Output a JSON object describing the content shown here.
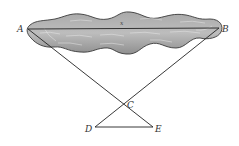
{
  "diagram": {
    "title": "",
    "colors": {
      "background": "#ffffff",
      "lake_fill": "#9a9a9a",
      "lake_fill_light": "#c4c4c4",
      "lake_stroke": "#3a3a3a",
      "line": "#222222",
      "label": "#333333",
      "ripple": "#e6e6e6"
    },
    "points": {
      "A": {
        "label": "A",
        "x": 28,
        "y": 29
      },
      "B": {
        "label": "B",
        "x": 219,
        "y": 28
      },
      "C": {
        "label": "C",
        "x": 123,
        "y": 104
      },
      "D": {
        "label": "D",
        "x": 95,
        "y": 127
      },
      "E": {
        "label": "E",
        "x": 153,
        "y": 127
      }
    },
    "segments": [
      {
        "from": "A",
        "to": "B"
      },
      {
        "from": "A",
        "to": "E"
      },
      {
        "from": "B",
        "to": "D"
      },
      {
        "from": "D",
        "to": "E"
      }
    ],
    "distance_label": {
      "text": "x",
      "segment": "AB"
    },
    "lake": {
      "name": "lake",
      "note": "irregular shaded region containing segment AB"
    }
  }
}
